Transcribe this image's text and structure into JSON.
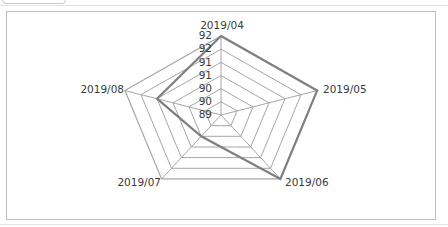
{
  "chart_data": {
    "type": "radar",
    "title": "",
    "categories": [
      "2019/04",
      "2019/05",
      "2019/06",
      "2019/07",
      "2019/08"
    ],
    "series": [
      {
        "name": "Series 1",
        "values": [
          92,
          92,
          92,
          90,
          91
        ],
        "color": "#7f7f7f"
      }
    ],
    "radial_axis": {
      "min": 89,
      "max": 92,
      "step": 0.5,
      "tick_labels": [
        "89",
        "90",
        "90",
        "91",
        "91",
        "92",
        "92"
      ]
    },
    "grid": true,
    "legend": "none"
  },
  "colors": {
    "grid": "#a6a6a6",
    "series": "#808080",
    "frame": "#bdbdbd",
    "text": "#3a3a3a"
  }
}
